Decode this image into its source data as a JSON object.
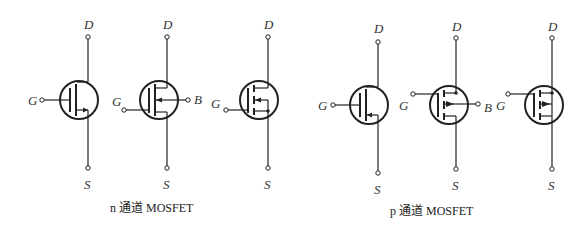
{
  "figure": {
    "groups": [
      {
        "caption": "n 通道 MOSFET",
        "symbols": [
          {
            "type": "n-channel 3-terminal",
            "labels": {
              "drain": "D",
              "gate": "G",
              "source": "S"
            }
          },
          {
            "type": "n-channel 4-terminal with body",
            "labels": {
              "drain": "D",
              "gate": "G",
              "source": "S",
              "body": "B"
            }
          },
          {
            "type": "n-channel enhancement (segmented channel)",
            "labels": {
              "drain": "D",
              "gate": "G",
              "source": "S"
            }
          }
        ]
      },
      {
        "caption": "p 通道 MOSFET",
        "symbols": [
          {
            "type": "p-channel 3-terminal",
            "labels": {
              "drain": "D",
              "gate": "G",
              "source": "S"
            }
          },
          {
            "type": "p-channel 4-terminal with body",
            "labels": {
              "drain": "D",
              "gate": "G",
              "source": "S",
              "body": "B"
            }
          },
          {
            "type": "p-channel enhancement (segmented channel)",
            "labels": {
              "drain": "D",
              "gate": "G",
              "source": "S"
            }
          }
        ]
      }
    ],
    "colors": {
      "line": "#222222",
      "background": "#ffffff"
    }
  }
}
